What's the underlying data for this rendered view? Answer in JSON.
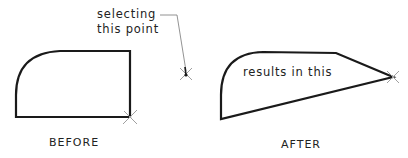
{
  "labels": {
    "before": "BEFORE",
    "after": "AFTER",
    "callout_line1": "selecting",
    "callout_line2": "this point",
    "result_text": "results in this"
  },
  "colors": {
    "stroke": "#1a1a1a",
    "marker": "#9a9a9a",
    "leader": "#777777",
    "background": "#ffffff"
  },
  "geometry": {
    "before_shape": {
      "bottom_left": [
        16,
        117
      ],
      "bottom_right": [
        130,
        117
      ],
      "top_right": [
        130,
        51
      ],
      "arc_start": [
        58,
        51
      ],
      "arc_end": [
        16,
        95
      ]
    },
    "after_shape": {
      "bottom_left": [
        221,
        119
      ],
      "arc_end": [
        221,
        95
      ],
      "arc_start": [
        263,
        52
      ],
      "top_right": [
        336,
        53
      ],
      "tip": [
        393,
        77
      ]
    },
    "selected_point": [
      186,
      74
    ],
    "before_marker": [
      130,
      117
    ],
    "after_marker": [
      393,
      77
    ]
  }
}
